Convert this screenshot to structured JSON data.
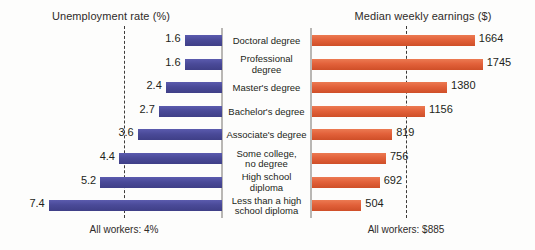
{
  "chart_data": {
    "type": "bar",
    "title": "",
    "orientation": "horizontal-diverging",
    "categories": [
      "Doctoral degree",
      "Professional degree",
      "Master's degree",
      "Bachelor's degree",
      "Associate's degree",
      "Some college, no degree",
      "High school diploma",
      "Less than a high school diploma"
    ],
    "category_lines": [
      [
        "Doctoral degree"
      ],
      [
        "Professional",
        "degree"
      ],
      [
        "Master's degree"
      ],
      [
        "Bachelor's degree"
      ],
      [
        "Associate's degree"
      ],
      [
        "Some college,",
        "no degree"
      ],
      [
        "High school",
        "diploma"
      ],
      [
        "Less than a high",
        "school diploma"
      ]
    ],
    "series": [
      {
        "name": "Unemployment rate (%)",
        "side": "left",
        "color": "#4a4a98",
        "unit": "%",
        "values": [
          1.6,
          1.6,
          2.4,
          2.7,
          3.6,
          4.4,
          5.2,
          7.4
        ],
        "labels": [
          "1.6",
          "1.6",
          "2.4",
          "2.7",
          "3.6",
          "4.4",
          "5.2",
          "7.4"
        ],
        "axis_max": 8.2,
        "reference": {
          "value": 4,
          "label": "All workers: 4%"
        }
      },
      {
        "name": "Median weekly earnings ($)",
        "side": "right",
        "color": "#e2613a",
        "unit": "$",
        "values": [
          1664,
          1745,
          1380,
          1156,
          819,
          756,
          692,
          504
        ],
        "labels": [
          "1664",
          "1745",
          "1380",
          "1156",
          "819",
          "756",
          "692",
          "504"
        ],
        "axis_max": 1860,
        "reference": {
          "value": 885,
          "label": "All workers: $885"
        }
      }
    ],
    "grid": false,
    "legend": "none"
  },
  "left_panel": {
    "title": "Unemployment rate (%)",
    "footer": "All workers: 4%"
  },
  "right_panel": {
    "title": "Median weekly earnings ($)",
    "footer": "All workers: $885"
  }
}
